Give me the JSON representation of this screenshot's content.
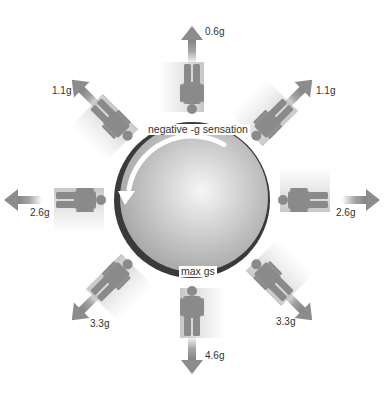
{
  "diagram": {
    "center": {
      "x": 192,
      "y": 200
    },
    "sphere_radius": 78,
    "colors": {
      "figure": "#8a8a8a",
      "arrow": "#8c8c8c",
      "rim": "#3a3a3a",
      "sphere_light": "#f4f4f4",
      "sphere_dark": "#a8a8a8",
      "text": "#333333"
    },
    "annotations": {
      "top": "negative  -g sensation",
      "bottom": "max gs"
    },
    "positions": [
      {
        "id": "top",
        "angle": -90,
        "g": "0.6g",
        "label_x": 205,
        "label_y": 26
      },
      {
        "id": "top-right",
        "angle": -45,
        "g": "1.1g",
        "label_x": 316,
        "label_y": 85
      },
      {
        "id": "right",
        "angle": 0,
        "g": "2.6g",
        "label_x": 336,
        "label_y": 207
      },
      {
        "id": "bottom-right",
        "angle": 45,
        "g": "3.3g",
        "label_x": 276,
        "label_y": 316
      },
      {
        "id": "bottom",
        "angle": 90,
        "g": "4.6g",
        "label_x": 205,
        "label_y": 350
      },
      {
        "id": "bottom-left",
        "angle": 135,
        "g": "3.3g",
        "label_x": 90,
        "label_y": 318
      },
      {
        "id": "left",
        "angle": 180,
        "g": "2.6g",
        "label_x": 30,
        "label_y": 207
      },
      {
        "id": "top-left",
        "angle": -135,
        "g": "1.1g",
        "label_x": 52,
        "label_y": 85
      }
    ]
  }
}
